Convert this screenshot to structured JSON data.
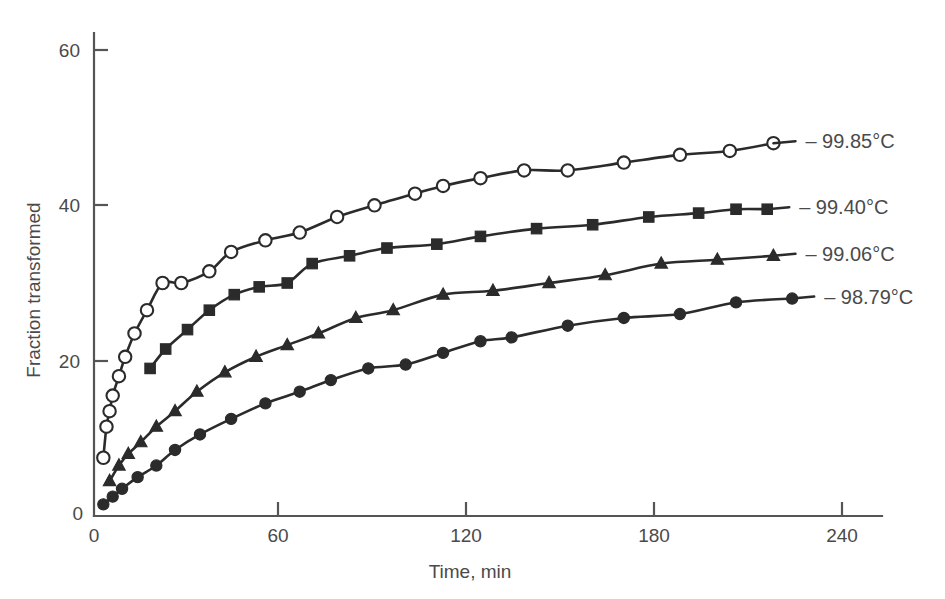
{
  "chart_data": {
    "type": "line",
    "title": "",
    "subtitle": "",
    "xlabel": "Time, min",
    "ylabel": "Fraction transformed",
    "xlim": [
      0,
      252
    ],
    "ylim": [
      0,
      66
    ],
    "xticks": [
      0,
      60,
      120,
      180,
      240
    ],
    "yticks": [
      0,
      20,
      40,
      60
    ],
    "xtick_labels": [
      "0",
      "60",
      "120",
      "180",
      "240"
    ],
    "ytick_labels": [
      "0",
      "20",
      "40",
      "60"
    ],
    "grid": false,
    "legend_position": "right-inline-labels",
    "series": [
      {
        "name": "99.85°C",
        "label": "– 99.85°C",
        "marker": "open-circle",
        "color": "#2b2b2b",
        "points": [
          [
            3,
            7.5
          ],
          [
            4,
            11.5
          ],
          [
            5,
            13.5
          ],
          [
            6,
            15.5
          ],
          [
            8,
            18.0
          ],
          [
            10,
            20.5
          ],
          [
            13,
            23.5
          ],
          [
            17,
            26.5
          ],
          [
            22,
            30.0
          ],
          [
            28,
            30.0
          ],
          [
            37,
            31.5
          ],
          [
            44,
            34.0
          ],
          [
            55,
            35.5
          ],
          [
            66,
            36.5
          ],
          [
            78,
            38.5
          ],
          [
            90,
            40.0
          ],
          [
            103,
            41.5
          ],
          [
            112,
            42.5
          ],
          [
            124,
            43.5
          ],
          [
            138,
            44.5
          ],
          [
            152,
            44.5
          ],
          [
            170,
            45.5
          ],
          [
            188,
            46.5
          ],
          [
            204,
            47.0
          ],
          [
            218,
            48.0
          ]
        ]
      },
      {
        "name": "99.40°C",
        "label": "– 99.40°C",
        "marker": "filled-square",
        "color": "#2b2b2b",
        "points": [
          [
            18,
            19.0
          ],
          [
            23,
            21.5
          ],
          [
            30,
            24.0
          ],
          [
            37,
            26.5
          ],
          [
            45,
            28.5
          ],
          [
            53,
            29.5
          ],
          [
            62,
            30.0
          ],
          [
            70,
            32.5
          ],
          [
            82,
            33.5
          ],
          [
            94,
            34.5
          ],
          [
            110,
            35.0
          ],
          [
            124,
            36.0
          ],
          [
            142,
            37.0
          ],
          [
            160,
            37.5
          ],
          [
            178,
            38.5
          ],
          [
            194,
            39.0
          ],
          [
            206,
            39.5
          ],
          [
            216,
            39.5
          ]
        ]
      },
      {
        "name": "99.06°C",
        "label": "– 99.06°C",
        "marker": "filled-triangle",
        "color": "#2b2b2b",
        "points": [
          [
            5,
            4.5
          ],
          [
            8,
            6.5
          ],
          [
            11,
            8.0
          ],
          [
            15,
            9.5
          ],
          [
            20,
            11.5
          ],
          [
            26,
            13.5
          ],
          [
            33,
            16.0
          ],
          [
            42,
            18.5
          ],
          [
            52,
            20.5
          ],
          [
            62,
            22.0
          ],
          [
            72,
            23.5
          ],
          [
            84,
            25.5
          ],
          [
            96,
            26.5
          ],
          [
            112,
            28.5
          ],
          [
            128,
            29.0
          ],
          [
            146,
            30.0
          ],
          [
            164,
            31.0
          ],
          [
            182,
            32.5
          ],
          [
            200,
            33.0
          ],
          [
            218,
            33.5
          ]
        ]
      },
      {
        "name": "98.79°C",
        "label": "– 98.79°C",
        "marker": "filled-circle",
        "color": "#2b2b2b",
        "points": [
          [
            3,
            1.5
          ],
          [
            6,
            2.5
          ],
          [
            9,
            3.5
          ],
          [
            14,
            5.0
          ],
          [
            20,
            6.5
          ],
          [
            26,
            8.5
          ],
          [
            34,
            10.5
          ],
          [
            44,
            12.5
          ],
          [
            55,
            14.5
          ],
          [
            66,
            16.0
          ],
          [
            76,
            17.5
          ],
          [
            88,
            19.0
          ],
          [
            100,
            19.5
          ],
          [
            112,
            21.0
          ],
          [
            124,
            22.5
          ],
          [
            134,
            23.0
          ],
          [
            152,
            24.5
          ],
          [
            170,
            25.5
          ],
          [
            188,
            26.0
          ],
          [
            206,
            27.5
          ],
          [
            224,
            28.0
          ]
        ]
      }
    ]
  }
}
